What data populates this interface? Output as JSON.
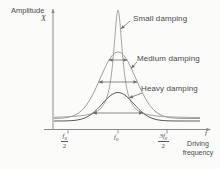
{
  "labels": {
    "y_axis_line1": "Amplitude",
    "y_axis_symbol": "X",
    "x_axis_line1": "Driving",
    "x_axis_line2": "frequency",
    "x_axis_end_symbol": "f"
  },
  "ticks": [
    {
      "num_base": "f",
      "num_sub": "0",
      "den": "2"
    },
    {
      "base": "f",
      "sub": "0"
    },
    {
      "num_base": "3f",
      "num_sub": "0",
      "den": "2"
    }
  ],
  "chart_data": {
    "type": "line",
    "xlabel": "Driving frequency",
    "ylabel": "Amplitude X",
    "x_tick_labels": [
      "f0/2",
      "f0",
      "3f0/2"
    ],
    "x_axis_end_symbol": "f",
    "peak_frequency": "f0",
    "axis_color": "#8c8c8c",
    "arrow_color": "#6f6f6f",
    "plot_x_range": [
      54,
      200
    ],
    "series": [
      {
        "name": "Small damping",
        "profile": "lorentzian",
        "center_x": 118,
        "base_y": 118,
        "peak_px": 108,
        "width_px": 5.4,
        "color": "#a6a6a6"
      },
      {
        "name": "Medium damping",
        "profile": "gaussian",
        "center_x": 118,
        "base_y": 118.5,
        "peak_px": 66.5,
        "width_px": 25,
        "color": "#9c9c9c"
      },
      {
        "name": "Heavy damping",
        "profile": "gaussian",
        "center_x": 118,
        "base_y": 121,
        "peak_px": 28.5,
        "width_px": 22.2,
        "color": "#5c5c5c"
      }
    ],
    "bandwidth_arrows": [
      {
        "y": 60,
        "x1": 108.7,
        "x2": 127.3
      },
      {
        "y": 82,
        "x1": 98.6,
        "x2": 137.4
      },
      {
        "y": 113,
        "x1": 92.9,
        "x2": 143.1
      }
    ]
  }
}
